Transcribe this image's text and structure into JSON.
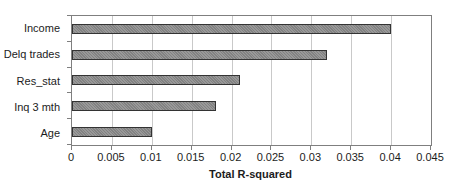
{
  "chart_data": {
    "type": "bar",
    "orientation": "horizontal",
    "title": "",
    "xlabel": "Total R-squared",
    "ylabel": "",
    "categories": [
      "Income",
      "Delq trades",
      "Res_stat",
      "Inq 3 mth",
      "Age"
    ],
    "values": [
      0.04,
      0.032,
      0.021,
      0.018,
      0.01
    ],
    "xlim": [
      0,
      0.045
    ],
    "x_ticks": [
      0,
      0.005,
      0.01,
      0.015,
      0.02,
      0.025,
      0.03,
      0.035,
      0.04,
      0.045
    ],
    "x_tick_labels": [
      "0",
      "0.005",
      "0.01",
      "0.015",
      "0.02",
      "0.025",
      "0.03",
      "0.035",
      "0.04",
      "0.045"
    ],
    "grid": "vertical",
    "legend": "none",
    "colors": {
      "bar_fill": "#8d8d8d",
      "bar_border": "#333333",
      "gridline": "#c9c9c9",
      "axis_border": "#7f7f7f",
      "text": "#1c1c1c",
      "background": "#ffffff"
    }
  }
}
